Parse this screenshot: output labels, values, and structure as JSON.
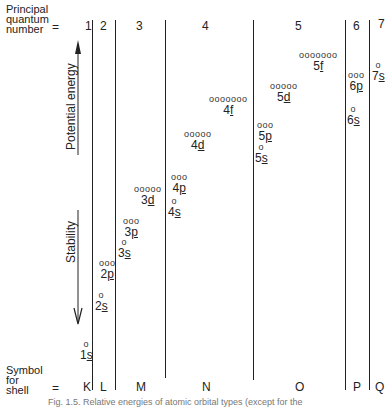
{
  "header": {
    "row_label_line1": "Principal",
    "row_label_line2": "quantum",
    "row_label_line3": "number",
    "equals": "=",
    "principal_numbers": [
      "1",
      "2",
      "3",
      "4",
      "5",
      "6",
      "7"
    ]
  },
  "footer": {
    "row_label_line1": "Symbol",
    "row_label_line2": "for",
    "row_label_line3": "shell",
    "equals": "=",
    "shell_symbols": [
      "K",
      "L",
      "M",
      "N",
      "O",
      "P",
      "Q"
    ]
  },
  "axis": {
    "up_label": "Potential energy",
    "down_label": "Stability"
  },
  "orbitals": [
    {
      "n": "1",
      "l": "s",
      "circles": "o"
    },
    {
      "n": "2",
      "l": "s",
      "circles": "o"
    },
    {
      "n": "2",
      "l": "p",
      "circles": "ooo"
    },
    {
      "n": "3",
      "l": "s",
      "circles": "o"
    },
    {
      "n": "3",
      "l": "p",
      "circles": "ooo"
    },
    {
      "n": "3",
      "l": "d",
      "circles": "ooooo"
    },
    {
      "n": "4",
      "l": "s",
      "circles": "o"
    },
    {
      "n": "4",
      "l": "p",
      "circles": "ooo"
    },
    {
      "n": "4",
      "l": "d",
      "circles": "ooooo"
    },
    {
      "n": "4",
      "l": "f",
      "circles": "ooooooo"
    },
    {
      "n": "5",
      "l": "s",
      "circles": "o"
    },
    {
      "n": "5",
      "l": "p",
      "circles": "ooo"
    },
    {
      "n": "5",
      "l": "d",
      "circles": "ooooo"
    },
    {
      "n": "5",
      "l": "f",
      "circles": "ooooooo"
    },
    {
      "n": "6",
      "l": "s",
      "circles": "o"
    },
    {
      "n": "6",
      "l": "p",
      "circles": "ooo"
    },
    {
      "n": "7",
      "l": "s",
      "circles": "o"
    }
  ],
  "caption": "Fig. 1.5. Relative energies of atomic orbital types (except for the"
}
